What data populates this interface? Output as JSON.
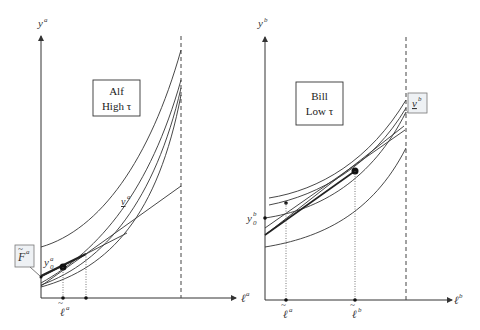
{
  "left_panel": {
    "y_axis_label": "y",
    "y_axis_sup": "a",
    "x_axis_label": "ℓ",
    "x_axis_sup": "a",
    "box_line1": "Alf",
    "box_line2": "High τ",
    "curve_label": "v",
    "curve_label_sup": "a",
    "intercept_label": "y",
    "intercept_sub": "0",
    "intercept_sup": "a",
    "callout_label": "F",
    "callout_sup": "a",
    "tick_label": "ℓ",
    "tick_sup": "a"
  },
  "right_panel": {
    "y_axis_label": "y",
    "y_axis_sup": "b",
    "x_axis_label": "ℓ",
    "x_axis_sup": "b",
    "box_line1": "Bill",
    "box_line2": "Low τ",
    "callout_label": "v",
    "callout_sup": "b",
    "intercept_label": "y",
    "intercept_sub": "0",
    "intercept_sup": "b",
    "tick1_label": "ℓ",
    "tick1_sup": "a",
    "tick2_label": "ℓ",
    "tick2_sup": "b"
  },
  "colors": {
    "line": "#333333",
    "dashed": "#444444",
    "callout_fill": "#eef1f4"
  }
}
